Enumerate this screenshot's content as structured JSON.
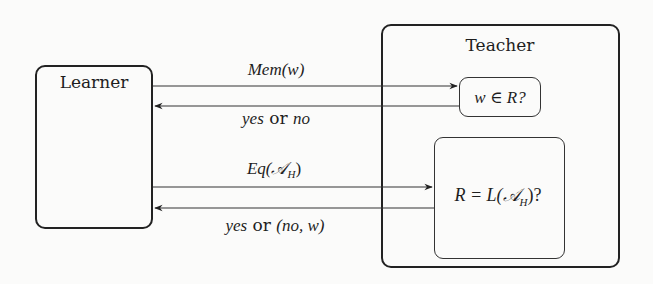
{
  "diagram": {
    "learner": {
      "label": "Learner"
    },
    "teacher": {
      "label": "Teacher",
      "membership_box": {
        "text": "w ∈ R?"
      },
      "equivalence_box": {
        "text": "R = L(𝒜H)?",
        "main": "R = L(𝒜",
        "sub": "H",
        "tail": ")?"
      }
    },
    "edges": [
      {
        "from": "Learner",
        "to": "membership_box",
        "label": "Mem(w)"
      },
      {
        "from": "membership_box",
        "to": "Learner",
        "label": "yes or no",
        "label_parts": [
          "yes",
          "or",
          "no"
        ]
      },
      {
        "from": "Learner",
        "to": "equivalence_box",
        "label": "Eq(𝒜H)",
        "main": "Eq(𝒜",
        "sub": "H",
        "tail": ")"
      },
      {
        "from": "equivalence_box",
        "to": "Learner",
        "label": "yes or (no, w)",
        "label_parts": [
          "yes",
          "or",
          "(no, w)"
        ]
      }
    ],
    "colors": {
      "stroke": "#222222",
      "background": "#fbfbfa"
    }
  }
}
